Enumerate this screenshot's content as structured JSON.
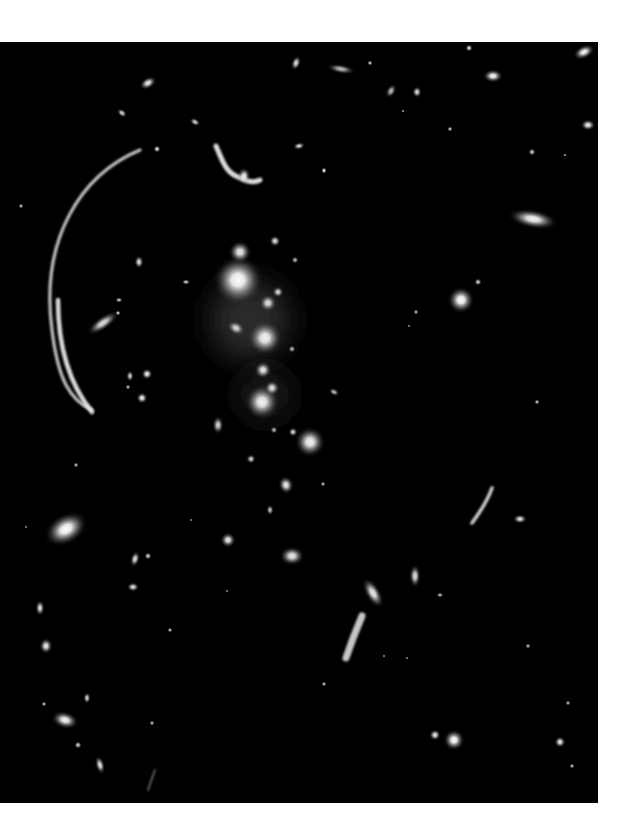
{
  "image": {
    "subject": "galaxy-cluster-with-gravitational-lensing-arcs",
    "background_color": "#000000",
    "page_color": "#ffffff",
    "frame": {
      "x": 0,
      "y": 42,
      "width": 598,
      "height": 761
    },
    "galaxies": [
      {
        "x": 238,
        "y": 280,
        "r": 26,
        "rx": 1,
        "ry": 1,
        "rot": 0,
        "b": 1.0
      },
      {
        "x": 240,
        "y": 252,
        "r": 12,
        "rx": 1,
        "ry": 1,
        "rot": 0,
        "b": 0.9
      },
      {
        "x": 265,
        "y": 338,
        "r": 18,
        "rx": 1,
        "ry": 1,
        "rot": 0,
        "b": 0.95
      },
      {
        "x": 268,
        "y": 303,
        "r": 9,
        "rx": 1,
        "ry": 1,
        "rot": 0,
        "b": 0.85
      },
      {
        "x": 278,
        "y": 292,
        "r": 6,
        "rx": 1,
        "ry": 1,
        "rot": 0,
        "b": 0.8
      },
      {
        "x": 263,
        "y": 370,
        "r": 9,
        "rx": 1,
        "ry": 1,
        "rot": 0,
        "b": 0.9
      },
      {
        "x": 236,
        "y": 328,
        "r": 7,
        "rx": 1.4,
        "ry": 1,
        "rot": 30,
        "b": 0.8
      },
      {
        "x": 262,
        "y": 402,
        "r": 18,
        "rx": 1,
        "ry": 1,
        "rot": 0,
        "b": 0.95
      },
      {
        "x": 272,
        "y": 388,
        "r": 8,
        "rx": 1,
        "ry": 1,
        "rot": 0,
        "b": 0.85
      },
      {
        "x": 310,
        "y": 442,
        "r": 16,
        "rx": 1,
        "ry": 1,
        "rot": 0,
        "b": 0.95
      },
      {
        "x": 293,
        "y": 432,
        "r": 5,
        "rx": 1,
        "ry": 1,
        "rot": 0,
        "b": 0.8
      },
      {
        "x": 218,
        "y": 425,
        "r": 6,
        "rx": 1,
        "ry": 1.6,
        "rot": 0,
        "b": 0.8
      },
      {
        "x": 275,
        "y": 241,
        "r": 6,
        "rx": 1,
        "ry": 1,
        "rot": 0,
        "b": 0.85
      },
      {
        "x": 295,
        "y": 260,
        "r": 4,
        "rx": 1,
        "ry": 1,
        "rot": 0,
        "b": 0.7
      },
      {
        "x": 292,
        "y": 349,
        "r": 4,
        "rx": 1,
        "ry": 1,
        "rot": 0,
        "b": 0.7
      },
      {
        "x": 334,
        "y": 392,
        "r": 4,
        "rx": 1.5,
        "ry": 1,
        "rot": 30,
        "b": 0.7
      },
      {
        "x": 274,
        "y": 430,
        "r": 4,
        "rx": 1,
        "ry": 1,
        "rot": 0,
        "b": 0.7
      },
      {
        "x": 251,
        "y": 459,
        "r": 5,
        "rx": 1,
        "ry": 1,
        "rot": 0,
        "b": 0.8
      },
      {
        "x": 461,
        "y": 300,
        "r": 14,
        "rx": 1,
        "ry": 1,
        "rot": 0,
        "b": 1.0
      },
      {
        "x": 478,
        "y": 282,
        "r": 4,
        "rx": 1,
        "ry": 1,
        "rot": 0,
        "b": 0.8
      },
      {
        "x": 533,
        "y": 219,
        "r": 10,
        "rx": 2.6,
        "ry": 1,
        "rot": 10,
        "b": 0.95
      },
      {
        "x": 416,
        "y": 312,
        "r": 3,
        "rx": 1,
        "ry": 1,
        "rot": 0,
        "b": 0.7
      },
      {
        "x": 409,
        "y": 326,
        "r": 2,
        "rx": 1,
        "ry": 1,
        "rot": 0,
        "b": 0.6
      },
      {
        "x": 66,
        "y": 529,
        "r": 16,
        "rx": 1.5,
        "ry": 1,
        "rot": -30,
        "b": 1.0
      },
      {
        "x": 135,
        "y": 559,
        "r": 5,
        "rx": 1,
        "ry": 1.7,
        "rot": 15,
        "b": 0.85
      },
      {
        "x": 148,
        "y": 556,
        "r": 4,
        "rx": 1,
        "ry": 1,
        "rot": 0,
        "b": 0.8
      },
      {
        "x": 133,
        "y": 587,
        "r": 5,
        "rx": 1.3,
        "ry": 1,
        "rot": 0,
        "b": 0.85
      },
      {
        "x": 40,
        "y": 608,
        "r": 5,
        "rx": 1,
        "ry": 1.7,
        "rot": 0,
        "b": 0.85
      },
      {
        "x": 46,
        "y": 646,
        "r": 7,
        "rx": 1,
        "ry": 1.2,
        "rot": 0,
        "b": 0.9
      },
      {
        "x": 170,
        "y": 630,
        "r": 3,
        "rx": 1,
        "ry": 1,
        "rot": 0,
        "b": 0.7
      },
      {
        "x": 87,
        "y": 698,
        "r": 4,
        "rx": 1,
        "ry": 1.5,
        "rot": 0,
        "b": 0.8
      },
      {
        "x": 44,
        "y": 704,
        "r": 3,
        "rx": 1,
        "ry": 1,
        "rot": 0,
        "b": 0.7
      },
      {
        "x": 65,
        "y": 720,
        "r": 9,
        "rx": 1.6,
        "ry": 1,
        "rot": 15,
        "b": 0.95
      },
      {
        "x": 78,
        "y": 745,
        "r": 4,
        "rx": 1,
        "ry": 1,
        "rot": 0,
        "b": 0.8
      },
      {
        "x": 100,
        "y": 765,
        "r": 5,
        "rx": 1,
        "ry": 2,
        "rot": -15,
        "b": 0.85
      },
      {
        "x": 152,
        "y": 723,
        "r": 3,
        "rx": 1,
        "ry": 1,
        "rot": 0,
        "b": 0.7
      },
      {
        "x": 228,
        "y": 540,
        "r": 8,
        "rx": 1,
        "ry": 1,
        "rot": 0,
        "b": 0.9
      },
      {
        "x": 286,
        "y": 485,
        "r": 8,
        "rx": 1,
        "ry": 1.2,
        "rot": -15,
        "b": 0.9
      },
      {
        "x": 270,
        "y": 510,
        "r": 4,
        "rx": 1,
        "ry": 1.4,
        "rot": 0,
        "b": 0.75
      },
      {
        "x": 292,
        "y": 556,
        "r": 10,
        "rx": 1.3,
        "ry": 1,
        "rot": 0,
        "b": 0.9
      },
      {
        "x": 373,
        "y": 593,
        "r": 8,
        "rx": 1,
        "ry": 2.2,
        "rot": -30,
        "b": 0.9
      },
      {
        "x": 415,
        "y": 576,
        "r": 6,
        "rx": 1,
        "ry": 2,
        "rot": 0,
        "b": 0.85
      },
      {
        "x": 520,
        "y": 519,
        "r": 5,
        "rx": 1.5,
        "ry": 1,
        "rot": 0,
        "b": 0.85
      },
      {
        "x": 323,
        "y": 484,
        "r": 3,
        "rx": 1,
        "ry": 1,
        "rot": 0,
        "b": 0.7
      },
      {
        "x": 454,
        "y": 740,
        "r": 11,
        "rx": 1,
        "ry": 1,
        "rot": 0,
        "b": 1.0
      },
      {
        "x": 435,
        "y": 735,
        "r": 6,
        "rx": 1,
        "ry": 1,
        "rot": 0,
        "b": 0.9
      },
      {
        "x": 560,
        "y": 742,
        "r": 6,
        "rx": 1,
        "ry": 1,
        "rot": 0,
        "b": 0.9
      },
      {
        "x": 572,
        "y": 766,
        "r": 3,
        "rx": 1,
        "ry": 1,
        "rot": 0,
        "b": 0.7
      },
      {
        "x": 568,
        "y": 703,
        "r": 3,
        "rx": 1,
        "ry": 1,
        "rot": 0,
        "b": 0.7
      },
      {
        "x": 148,
        "y": 83,
        "r": 6,
        "rx": 1.6,
        "ry": 1,
        "rot": -30,
        "b": 0.9
      },
      {
        "x": 122,
        "y": 113,
        "r": 4,
        "rx": 1.5,
        "ry": 1,
        "rot": 40,
        "b": 0.8
      },
      {
        "x": 195,
        "y": 122,
        "r": 4,
        "rx": 1.5,
        "ry": 1,
        "rot": 30,
        "b": 0.8
      },
      {
        "x": 157,
        "y": 149,
        "r": 4,
        "rx": 1,
        "ry": 1,
        "rot": 0,
        "b": 0.85
      },
      {
        "x": 296,
        "y": 63,
        "r": 5,
        "rx": 1,
        "ry": 1.6,
        "rot": 20,
        "b": 0.85
      },
      {
        "x": 299,
        "y": 146,
        "r": 4,
        "rx": 1.6,
        "ry": 1,
        "rot": -10,
        "b": 0.8
      },
      {
        "x": 244,
        "y": 176,
        "r": 7,
        "rx": 1,
        "ry": 1.3,
        "rot": 0,
        "b": 0.9
      },
      {
        "x": 21,
        "y": 206,
        "r": 3,
        "rx": 1,
        "ry": 1,
        "rot": 0,
        "b": 0.7
      },
      {
        "x": 324,
        "y": 170,
        "r": 3,
        "rx": 1,
        "ry": 1,
        "rot": 0,
        "b": 0.7
      },
      {
        "x": 341,
        "y": 69,
        "r": 5,
        "rx": 3,
        "ry": 1,
        "rot": 10,
        "b": 0.7
      },
      {
        "x": 370,
        "y": 63,
        "r": 3,
        "rx": 1,
        "ry": 1,
        "rot": 0,
        "b": 0.75
      },
      {
        "x": 391,
        "y": 91,
        "r": 5,
        "rx": 1,
        "ry": 1.6,
        "rot": 30,
        "b": 0.7
      },
      {
        "x": 417,
        "y": 92,
        "r": 5,
        "rx": 1,
        "ry": 1.2,
        "rot": 0,
        "b": 0.85
      },
      {
        "x": 403,
        "y": 111,
        "r": 2,
        "rx": 1,
        "ry": 1,
        "rot": 0,
        "b": 0.7
      },
      {
        "x": 450,
        "y": 129,
        "r": 3,
        "rx": 1,
        "ry": 1,
        "rot": 0,
        "b": 0.75
      },
      {
        "x": 469,
        "y": 48,
        "r": 4,
        "rx": 1,
        "ry": 1,
        "rot": 0,
        "b": 0.85
      },
      {
        "x": 493,
        "y": 76,
        "r": 7,
        "rx": 1.5,
        "ry": 1,
        "rot": 0,
        "b": 0.95
      },
      {
        "x": 584,
        "y": 52,
        "r": 7,
        "rx": 1.7,
        "ry": 1,
        "rot": -25,
        "b": 0.95
      },
      {
        "x": 588,
        "y": 125,
        "r": 6,
        "rx": 1.3,
        "ry": 1,
        "rot": 0,
        "b": 0.9
      },
      {
        "x": 532,
        "y": 152,
        "r": 4,
        "rx": 1,
        "ry": 1,
        "rot": 0,
        "b": 0.8
      },
      {
        "x": 565,
        "y": 155,
        "r": 2,
        "rx": 1,
        "ry": 1,
        "rot": 0,
        "b": 0.7
      },
      {
        "x": 324,
        "y": 171,
        "r": 3,
        "rx": 1,
        "ry": 1,
        "rot": 0,
        "b": 0.7
      },
      {
        "x": 139,
        "y": 262,
        "r": 5,
        "rx": 1,
        "ry": 1.4,
        "rot": 0,
        "b": 0.85
      },
      {
        "x": 186,
        "y": 282,
        "r": 3,
        "rx": 1.5,
        "ry": 1,
        "rot": 0,
        "b": 0.8
      },
      {
        "x": 103,
        "y": 323,
        "r": 7,
        "rx": 2.8,
        "ry": 1,
        "rot": -35,
        "b": 0.85
      },
      {
        "x": 118,
        "y": 313,
        "r": 3,
        "rx": 1,
        "ry": 1,
        "rot": 0,
        "b": 0.8
      },
      {
        "x": 119,
        "y": 300,
        "r": 3,
        "rx": 1.4,
        "ry": 1,
        "rot": 0,
        "b": 0.75
      },
      {
        "x": 147,
        "y": 374,
        "r": 6,
        "rx": 1,
        "ry": 1,
        "rot": 0,
        "b": 0.9
      },
      {
        "x": 130,
        "y": 376,
        "r": 4,
        "rx": 1,
        "ry": 1.5,
        "rot": 0,
        "b": 0.8
      },
      {
        "x": 142,
        "y": 398,
        "r": 6,
        "rx": 1,
        "ry": 1,
        "rot": 0,
        "b": 0.9
      },
      {
        "x": 128,
        "y": 387,
        "r": 3,
        "rx": 1,
        "ry": 1,
        "rot": 0,
        "b": 0.7
      },
      {
        "x": 537,
        "y": 402,
        "r": 3,
        "rx": 1,
        "ry": 1,
        "rot": 0,
        "b": 0.75
      },
      {
        "x": 76,
        "y": 465,
        "r": 3,
        "rx": 1,
        "ry": 1,
        "rot": 0,
        "b": 0.7
      },
      {
        "x": 26,
        "y": 527,
        "r": 2,
        "rx": 1,
        "ry": 1,
        "rot": 0,
        "b": 0.6
      },
      {
        "x": 191,
        "y": 520,
        "r": 2,
        "rx": 1,
        "ry": 1,
        "rot": 0,
        "b": 0.6
      },
      {
        "x": 440,
        "y": 595,
        "r": 3,
        "rx": 1.3,
        "ry": 1,
        "rot": 0,
        "b": 0.7
      },
      {
        "x": 528,
        "y": 646,
        "r": 3,
        "rx": 1,
        "ry": 1,
        "rot": 0,
        "b": 0.7
      },
      {
        "x": 384,
        "y": 656,
        "r": 2,
        "rx": 1,
        "ry": 1,
        "rot": 0,
        "b": 0.6
      },
      {
        "x": 407,
        "y": 658,
        "r": 2,
        "rx": 1,
        "ry": 1,
        "rot": 0,
        "b": 0.6
      },
      {
        "x": 324,
        "y": 684,
        "r": 3,
        "rx": 1,
        "ry": 1,
        "rot": 0,
        "b": 0.7
      },
      {
        "x": 227,
        "y": 591,
        "r": 2,
        "rx": 1,
        "ry": 1,
        "rot": 0,
        "b": 0.6
      }
    ],
    "arcs": [
      {
        "name": "giant-arc-left",
        "d": "M 140 150 C 80 175, 40 240, 52 330 C 58 380, 70 400, 92 410",
        "w": 3.2,
        "b": 0.85
      },
      {
        "name": "giant-arc-left-bright",
        "d": "M 58 300 C 58 340, 66 380, 92 412",
        "w": 4.5,
        "b": 0.95
      },
      {
        "name": "arc-top",
        "d": "M 216 146 C 222 160, 226 172, 236 176 C 244 180, 252 184, 260 180",
        "w": 5,
        "b": 0.95
      },
      {
        "name": "arc-right",
        "d": "M 492 488 C 488 500, 480 512, 472 523",
        "w": 3.5,
        "b": 0.9
      },
      {
        "name": "arc-bottom-center",
        "d": "M 362 616 C 356 630, 350 646, 346 658",
        "w": 7,
        "b": 0.85
      },
      {
        "name": "arc-bottom-left",
        "d": "M 155 770 C 152 778, 150 784, 148 790",
        "w": 1.5,
        "b": 0.55
      }
    ]
  }
}
